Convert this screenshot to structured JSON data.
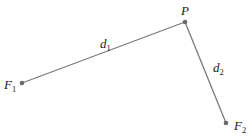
{
  "diagram": {
    "points": {
      "F1": {
        "label": "F",
        "subscript": "1",
        "x": 22,
        "y": 83
      },
      "P": {
        "label": "P",
        "x": 185,
        "y": 22
      },
      "F2": {
        "label": "F",
        "subscript": "2",
        "x": 226,
        "y": 123
      }
    },
    "segments": [
      {
        "from": "F1",
        "to": "P",
        "label": "d",
        "subscript": "1"
      },
      {
        "from": "P",
        "to": "F2",
        "label": "d",
        "subscript": "2"
      }
    ],
    "colors": {
      "line": "#7a7a7a",
      "point": "#6a6a6a",
      "text": "#222222"
    }
  }
}
